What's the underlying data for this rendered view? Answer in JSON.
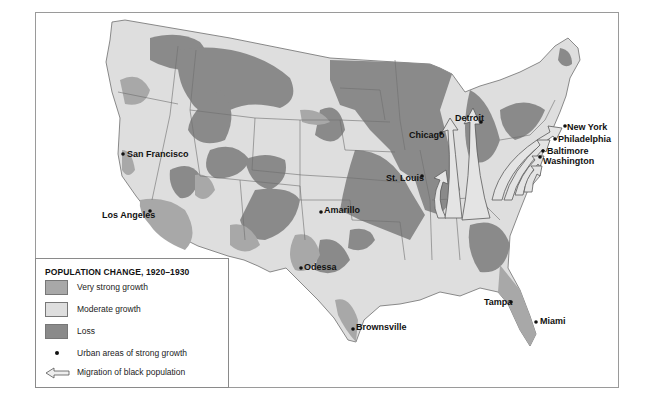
{
  "legend": {
    "title": "POPULATION CHANGE, 1920–1930",
    "items": [
      {
        "label": "Very strong growth",
        "color": "#a8a8a8",
        "type": "swatch"
      },
      {
        "label": "Moderate growth",
        "color": "#dedede",
        "type": "swatch"
      },
      {
        "label": "Loss",
        "color": "#8a8a8a",
        "type": "swatch"
      },
      {
        "label": "Urban areas of strong growth",
        "type": "dot"
      },
      {
        "label": "Migration of black population",
        "type": "arrow"
      }
    ]
  },
  "cities": [
    {
      "name": "San Francisco"
    },
    {
      "name": "Los Angeles"
    },
    {
      "name": "Amarillo"
    },
    {
      "name": "Odessa"
    },
    {
      "name": "Brownsville"
    },
    {
      "name": "St. Louis"
    },
    {
      "name": "Chicago"
    },
    {
      "name": "Detroit"
    },
    {
      "name": "New York"
    },
    {
      "name": "Philadelphia"
    },
    {
      "name": "Baltimore"
    },
    {
      "name": "Washington"
    },
    {
      "name": "Tampa"
    },
    {
      "name": "Miami"
    }
  ],
  "colors": {
    "very_strong": "#a8a8a8",
    "moderate": "#dedede",
    "loss": "#8a8a8a",
    "border": "#6f6f6f",
    "arrow_fill": "#e4e4e4"
  }
}
